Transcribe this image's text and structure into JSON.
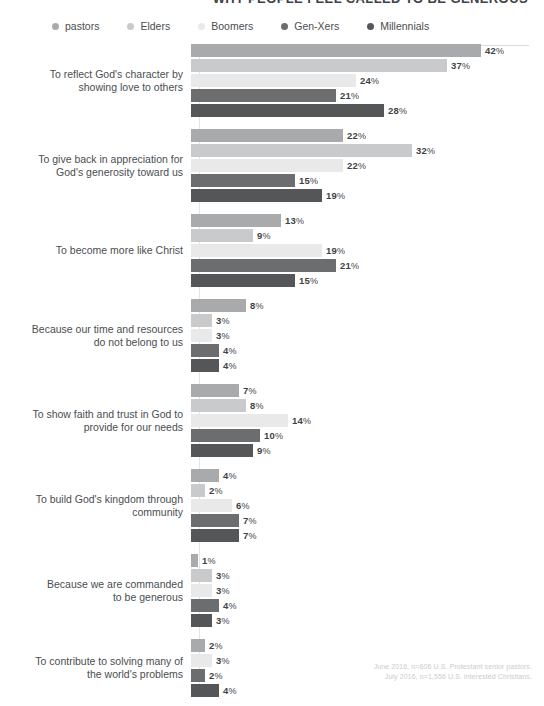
{
  "chart_data": {
    "type": "bar",
    "orientation": "horizontal",
    "title": "WHY PEOPLE FEEL CALLED TO BE GENEROUS",
    "xlabel": "",
    "ylabel": "",
    "xlim": [
      0,
      45
    ],
    "grid": false,
    "legend_position": "top",
    "legend": [
      "pastors",
      "Elders",
      "Boomers",
      "Gen-Xers",
      "Millennials"
    ],
    "colors": [
      "#a9aaab",
      "#c9cacb",
      "#e9e9ea",
      "#6b6d6f",
      "#545658"
    ],
    "categories": [
      "To reflect God's character by showing love to others",
      "To give back in appreciation for God's generosity toward us",
      "To become more like Christ",
      "Because our time and resources do not belong to us",
      "To show faith and trust in God to provide for our needs",
      "To build God's kingdom through community",
      "Because we are commanded to be generous",
      "To contribute to solving many of the world's problems"
    ],
    "series": [
      {
        "name": "pastors",
        "values": [
          42,
          22,
          13,
          8,
          7,
          4,
          1,
          2
        ]
      },
      {
        "name": "Elders",
        "values": [
          37,
          32,
          9,
          3,
          8,
          2,
          3,
          null
        ]
      },
      {
        "name": "Boomers",
        "values": [
          24,
          22,
          19,
          3,
          14,
          6,
          3,
          3
        ]
      },
      {
        "name": "Gen-Xers",
        "values": [
          21,
          15,
          21,
          4,
          10,
          7,
          4,
          2
        ]
      },
      {
        "name": "Millennials",
        "values": [
          28,
          19,
          15,
          4,
          9,
          7,
          3,
          4
        ]
      }
    ],
    "source_lines": [
      "June 2016, n=606 U.S. Protestant senior pastors.",
      "July 2016, n=1,556 U.S. interested Christians."
    ]
  },
  "groups": [
    {
      "label_line1": "To reflect God's character by",
      "label_line2": "showing love to others",
      "bars": [
        {
          "series": "pastors",
          "value": "42",
          "pct": "%",
          "width": 290,
          "color": "#a9aaab"
        },
        {
          "series": "Elders",
          "value": "37",
          "pct": "%",
          "width": 256,
          "color": "#c9cacb"
        },
        {
          "series": "Boomers",
          "value": "24",
          "pct": "%",
          "width": 165,
          "color": "#e9e9ea"
        },
        {
          "series": "Gen-Xers",
          "value": "21",
          "pct": "%",
          "width": 145,
          "color": "#6b6d6f"
        },
        {
          "series": "Millennials",
          "value": "28",
          "pct": "%",
          "width": 193,
          "color": "#545658"
        }
      ]
    },
    {
      "label_line1": "To give back in appreciation for",
      "label_line2": "God's generosity toward us",
      "bars": [
        {
          "series": "pastors",
          "value": "22",
          "pct": "%",
          "width": 152,
          "color": "#a9aaab"
        },
        {
          "series": "Elders",
          "value": "32",
          "pct": "%",
          "width": 221,
          "color": "#c9cacb"
        },
        {
          "series": "Boomers",
          "value": "22",
          "pct": "%",
          "width": 152,
          "color": "#e9e9ea"
        },
        {
          "series": "Gen-Xers",
          "value": "15",
          "pct": "%",
          "width": 104,
          "color": "#6b6d6f"
        },
        {
          "series": "Millennials",
          "value": "19",
          "pct": "%",
          "width": 131,
          "color": "#545658"
        }
      ]
    },
    {
      "label_line1": "To become more like Christ",
      "label_line2": "",
      "bars": [
        {
          "series": "pastors",
          "value": "13",
          "pct": "%",
          "width": 90,
          "color": "#a9aaab"
        },
        {
          "series": "Elders",
          "value": "9",
          "pct": "%",
          "width": 62,
          "color": "#c9cacb"
        },
        {
          "series": "Boomers",
          "value": "19",
          "pct": "%",
          "width": 131,
          "color": "#e9e9ea"
        },
        {
          "series": "Gen-Xers",
          "value": "21",
          "pct": "%",
          "width": 145,
          "color": "#6b6d6f"
        },
        {
          "series": "Millennials",
          "value": "15",
          "pct": "%",
          "width": 104,
          "color": "#545658"
        }
      ]
    },
    {
      "label_line1": "Because our time and resources",
      "label_line2": "do not belong to us",
      "bars": [
        {
          "series": "pastors",
          "value": "8",
          "pct": "%",
          "width": 55,
          "color": "#a9aaab"
        },
        {
          "series": "Elders",
          "value": "3",
          "pct": "%",
          "width": 21,
          "color": "#c9cacb"
        },
        {
          "series": "Boomers",
          "value": "3",
          "pct": "%",
          "width": 21,
          "color": "#e9e9ea"
        },
        {
          "series": "Gen-Xers",
          "value": "4",
          "pct": "%",
          "width": 28,
          "color": "#6b6d6f"
        },
        {
          "series": "Millennials",
          "value": "4",
          "pct": "%",
          "width": 28,
          "color": "#545658"
        }
      ]
    },
    {
      "label_line1": "To show faith and trust in God to",
      "label_line2": "provide for our needs",
      "bars": [
        {
          "series": "pastors",
          "value": "7",
          "pct": "%",
          "width": 48,
          "color": "#a9aaab"
        },
        {
          "series": "Elders",
          "value": "8",
          "pct": "%",
          "width": 55,
          "color": "#c9cacb"
        },
        {
          "series": "Boomers",
          "value": "14",
          "pct": "%",
          "width": 97,
          "color": "#e9e9ea"
        },
        {
          "series": "Gen-Xers",
          "value": "10",
          "pct": "%",
          "width": 69,
          "color": "#6b6d6f"
        },
        {
          "series": "Millennials",
          "value": "9",
          "pct": "%",
          "width": 62,
          "color": "#545658"
        }
      ]
    },
    {
      "label_line1": "To build God's kingdom through",
      "label_line2": "community",
      "bars": [
        {
          "series": "pastors",
          "value": "4",
          "pct": "%",
          "width": 28,
          "color": "#a9aaab"
        },
        {
          "series": "Elders",
          "value": "2",
          "pct": "%",
          "width": 14,
          "color": "#c9cacb"
        },
        {
          "series": "Boomers",
          "value": "6",
          "pct": "%",
          "width": 41,
          "color": "#e9e9ea"
        },
        {
          "series": "Gen-Xers",
          "value": "7",
          "pct": "%",
          "width": 48,
          "color": "#6b6d6f"
        },
        {
          "series": "Millennials",
          "value": "7",
          "pct": "%",
          "width": 48,
          "color": "#545658"
        }
      ]
    },
    {
      "label_line1": "Because we are commanded",
      "label_line2": "to be generous",
      "bars": [
        {
          "series": "pastors",
          "value": "1",
          "pct": "%",
          "width": 7,
          "color": "#a9aaab"
        },
        {
          "series": "Elders",
          "value": "3",
          "pct": "%",
          "width": 21,
          "color": "#c9cacb"
        },
        {
          "series": "Boomers",
          "value": "3",
          "pct": "%",
          "width": 21,
          "color": "#e9e9ea"
        },
        {
          "series": "Gen-Xers",
          "value": "4",
          "pct": "%",
          "width": 28,
          "color": "#6b6d6f"
        },
        {
          "series": "Millennials",
          "value": "3",
          "pct": "%",
          "width": 21,
          "color": "#545658"
        }
      ]
    },
    {
      "label_line1": "To contribute to solving many of",
      "label_line2": "the world's problems",
      "bars": [
        {
          "series": "pastors",
          "value": "2",
          "pct": "%",
          "width": 14,
          "color": "#a9aaab"
        },
        {
          "series": "Boomers",
          "value": "3",
          "pct": "%",
          "width": 21,
          "color": "#e9e9ea"
        },
        {
          "series": "Gen-Xers",
          "value": "2",
          "pct": "%",
          "width": 14,
          "color": "#6b6d6f"
        },
        {
          "series": "Millennials",
          "value": "4",
          "pct": "%",
          "width": 28,
          "color": "#545658"
        }
      ]
    }
  ],
  "legend": {
    "items": [
      {
        "label": "pastors",
        "color": "#a9aaab"
      },
      {
        "label": "Elders",
        "color": "#c9cacb"
      },
      {
        "label": "Boomers",
        "color": "#e9e9ea"
      },
      {
        "label": "Gen-Xers",
        "color": "#6b6d6f"
      },
      {
        "label": "Millennials",
        "color": "#545658"
      }
    ]
  },
  "source": {
    "line1": "June 2016, n=606 U.S. Protestant senior pastors.",
    "line2": "July 2016, n=1,556 U.S. interested Christians."
  },
  "title": "WHY PEOPLE FEEL CALLED TO BE GENEROUS"
}
